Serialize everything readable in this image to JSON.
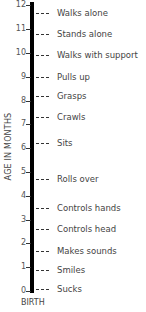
{
  "chart_data": {
    "type": "timeline",
    "title": "",
    "ylabel": "AGE IN MONTHS",
    "xlabel": "",
    "ylim": [
      0,
      12
    ],
    "y_ticks": [
      0,
      1,
      2,
      3,
      4,
      5,
      6,
      7,
      8,
      9,
      10,
      11,
      12
    ],
    "baseline_label": "BIRTH",
    "milestones": [
      {
        "label": "Walks alone",
        "month": 11.7
      },
      {
        "label": "Stands alone",
        "month": 10.8
      },
      {
        "label": "Walks with support",
        "month": 9.9
      },
      {
        "label": "Pulls up",
        "month": 9.0
      },
      {
        "label": "Grasps",
        "month": 8.2
      },
      {
        "label": "Crawls",
        "month": 7.3
      },
      {
        "label": "Sits",
        "month": 6.2
      },
      {
        "label": "Rolls over",
        "month": 4.7
      },
      {
        "label": "Controls hands",
        "month": 3.5
      },
      {
        "label": "Controls head",
        "month": 2.6
      },
      {
        "label": "Makes sounds",
        "month": 1.7
      },
      {
        "label": "Smiles",
        "month": 0.9
      },
      {
        "label": "Sucks",
        "month": 0.1
      }
    ],
    "colors": {
      "axis": "#000000",
      "text": "#444444"
    }
  }
}
